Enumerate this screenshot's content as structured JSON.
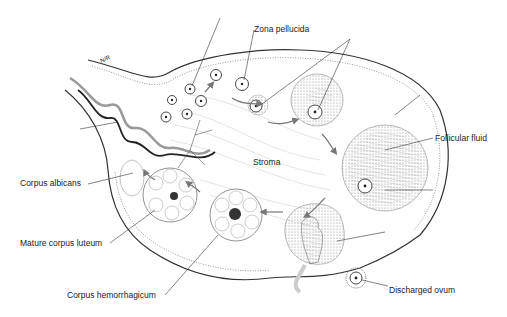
{
  "diagram": {
    "labels": {
      "zona_pellucida": "Zona pellucida",
      "follicular_fluid": "Follicular fluid",
      "stroma": "Stroma",
      "corpus_albicans": "Corpus albicans",
      "mature_corpus_luteum": "Mature corpus luteum",
      "corpus_hemorrhagicum": "Corpus hemorrhagicum",
      "discharged_ovum": "Discharged ovum",
      "vessel_mark": "N/R"
    },
    "colors": {
      "line": "#333333",
      "fill_dark": "#888888",
      "fill_light": "#cccccc"
    }
  }
}
